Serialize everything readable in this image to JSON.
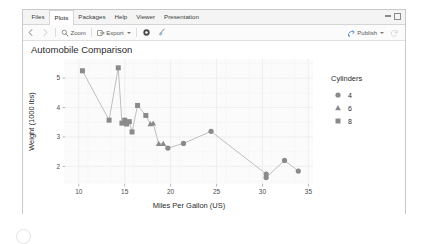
{
  "window": {
    "tabs": [
      {
        "label": "Files",
        "active": false
      },
      {
        "label": "Plots",
        "active": true
      },
      {
        "label": "Packages",
        "active": false
      },
      {
        "label": "Help",
        "active": false
      },
      {
        "label": "Viewer",
        "active": false
      },
      {
        "label": "Presentation",
        "active": false
      }
    ],
    "controls": {
      "minimize": "minimize-icon",
      "maximize": "maximize-icon"
    }
  },
  "toolbar": {
    "back_icon": "back-arrow-icon",
    "forward_icon": "forward-arrow-icon",
    "zoom_label": "Zoom",
    "zoom_icon": "magnifier-icon",
    "export_label": "Export",
    "export_icon": "export-icon",
    "export_caret": "chevron-down-icon",
    "remove_icon": "gear-icon",
    "clear_icon": "broom-icon",
    "publish_label": "Publish",
    "publish_icon": "publish-icon",
    "publish_caret": "chevron-down-icon",
    "refresh_icon": "refresh-icon"
  },
  "chart_data": {
    "type": "scatter",
    "title": "Automobile Comparison",
    "xlabel": "Miles Per Gallon (US)",
    "ylabel": "Weight (1000 lbs)",
    "xlim": [
      8.5,
      35.5
    ],
    "ylim": [
      1.4,
      5.65
    ],
    "xticks": [
      10,
      15,
      20,
      25,
      30,
      35
    ],
    "yticks": [
      2,
      3,
      4,
      5
    ],
    "grid": true,
    "legend": {
      "title": "Cylinders",
      "position": "right",
      "entries": [
        {
          "label": "4",
          "marker": "circle"
        },
        {
          "label": "6",
          "marker": "triangle"
        },
        {
          "label": "8",
          "marker": "square"
        }
      ]
    },
    "line_color": "#bfbfbf",
    "point_color": "#8a8a8a",
    "panel_background": "#fbfbfb",
    "grid_color": "#ececec",
    "connected": true,
    "points": [
      {
        "x": 10.4,
        "y": 5.25,
        "cyl": 8,
        "marker": "square"
      },
      {
        "x": 13.3,
        "y": 3.57,
        "cyl": 8,
        "marker": "square"
      },
      {
        "x": 14.3,
        "y": 5.35,
        "cyl": 8,
        "marker": "square"
      },
      {
        "x": 14.7,
        "y": 3.47,
        "cyl": 8,
        "marker": "square"
      },
      {
        "x": 15.0,
        "y": 3.57,
        "cyl": 8,
        "marker": "square"
      },
      {
        "x": 15.2,
        "y": 3.44,
        "cyl": 8,
        "marker": "square"
      },
      {
        "x": 15.5,
        "y": 3.52,
        "cyl": 8,
        "marker": "square"
      },
      {
        "x": 15.8,
        "y": 3.17,
        "cyl": 8,
        "marker": "square"
      },
      {
        "x": 16.4,
        "y": 4.07,
        "cyl": 8,
        "marker": "square"
      },
      {
        "x": 17.3,
        "y": 3.73,
        "cyl": 8,
        "marker": "square"
      },
      {
        "x": 17.8,
        "y": 3.44,
        "cyl": 6,
        "marker": "triangle"
      },
      {
        "x": 18.1,
        "y": 3.46,
        "cyl": 6,
        "marker": "triangle"
      },
      {
        "x": 18.7,
        "y": 2.77,
        "cyl": 6,
        "marker": "triangle"
      },
      {
        "x": 19.2,
        "y": 2.77,
        "cyl": 6,
        "marker": "triangle"
      },
      {
        "x": 19.7,
        "y": 2.62,
        "cyl": 4,
        "marker": "circle"
      },
      {
        "x": 21.4,
        "y": 2.78,
        "cyl": 4,
        "marker": "circle"
      },
      {
        "x": 24.4,
        "y": 3.19,
        "cyl": 4,
        "marker": "circle"
      },
      {
        "x": 30.4,
        "y": 1.74,
        "cyl": 4,
        "marker": "circle"
      },
      {
        "x": 30.4,
        "y": 1.62,
        "cyl": 4,
        "marker": "circle"
      },
      {
        "x": 32.4,
        "y": 2.2,
        "cyl": 4,
        "marker": "circle"
      },
      {
        "x": 33.9,
        "y": 1.84,
        "cyl": 4,
        "marker": "circle"
      }
    ]
  }
}
